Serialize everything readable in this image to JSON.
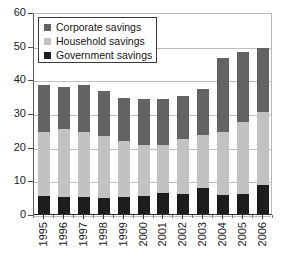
{
  "chart_data": {
    "type": "bar",
    "subtype": "stacked-column",
    "title": "",
    "xlabel": "",
    "ylabel": "",
    "ylim": [
      0,
      60
    ],
    "yticks": [
      0,
      10,
      20,
      30,
      40,
      50,
      60
    ],
    "grid": true,
    "legend_position": "top-left",
    "categories": [
      "1995",
      "1996",
      "1997",
      "1998",
      "1999",
      "2000",
      "2001",
      "2002",
      "2003",
      "2004",
      "2005",
      "2006"
    ],
    "series": [
      {
        "name": "Government savings",
        "color": "#1d1d1d",
        "values": [
          5.3,
          5.0,
          5.1,
          4.7,
          5.0,
          5.4,
          6.3,
          6.0,
          7.8,
          5.7,
          5.9,
          8.5
        ]
      },
      {
        "name": "Household savings",
        "color": "#c2c2c2",
        "values": [
          19.0,
          20.2,
          19.4,
          18.4,
          16.7,
          15.0,
          14.1,
          16.3,
          15.8,
          18.6,
          21.5,
          21.7
        ]
      },
      {
        "name": "Corporate savings",
        "color": "#636363",
        "values": [
          14.0,
          12.6,
          13.8,
          13.4,
          12.9,
          13.8,
          13.7,
          12.7,
          13.4,
          21.9,
          20.6,
          19.0
        ]
      }
    ],
    "totals": [
      38.3,
      37.8,
      38.3,
      36.5,
      34.6,
      34.2,
      34.1,
      35.0,
      37.0,
      46.2,
      48.0,
      49.2
    ]
  },
  "legend": {
    "items": [
      {
        "label": "Corporate savings",
        "color": "#636363"
      },
      {
        "label": "Household savings",
        "color": "#c2c2c2"
      },
      {
        "label": "Government savings",
        "color": "#1d1d1d"
      }
    ]
  }
}
